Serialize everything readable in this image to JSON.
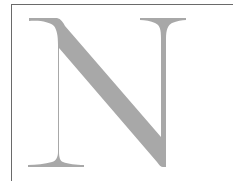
{
  "image": {
    "letter": "N",
    "letter_color": "#a8a8a8",
    "border_color": "#6a6a6a",
    "background": "#ffffff"
  }
}
